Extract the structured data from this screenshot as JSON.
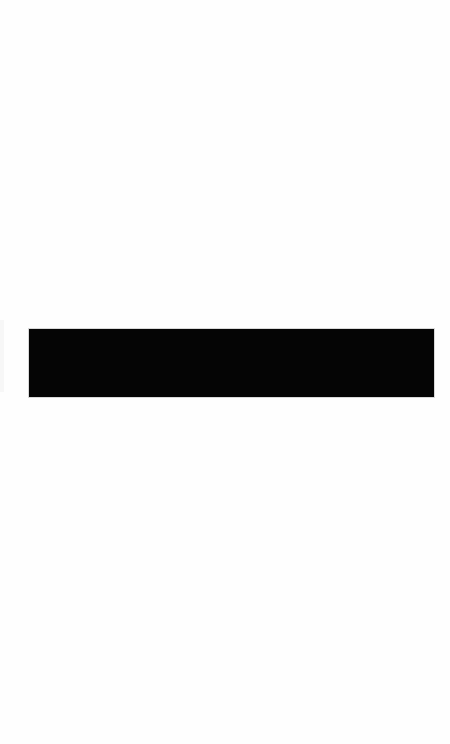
{
  "page": {
    "background_color": "#fefefe"
  },
  "media_block": {
    "fill_color": "#050505",
    "label": ""
  },
  "edge_strip": {
    "color": "#f7f7f7"
  }
}
